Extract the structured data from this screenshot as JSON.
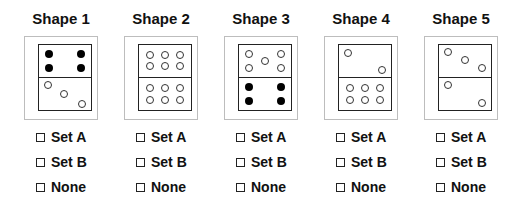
{
  "shapes": [
    {
      "title": "Shape 1",
      "center_x": 61,
      "top": [
        {
          "x": 0.2,
          "y": 0.3,
          "f": 1
        },
        {
          "x": 0.8,
          "y": 0.3,
          "f": 1
        },
        {
          "x": 0.2,
          "y": 0.72,
          "f": 1
        },
        {
          "x": 0.8,
          "y": 0.72,
          "f": 1
        }
      ],
      "bottom": [
        {
          "x": 0.18,
          "y": 0.22,
          "f": 0
        },
        {
          "x": 0.48,
          "y": 0.52,
          "f": 0
        },
        {
          "x": 0.82,
          "y": 0.8,
          "f": 0
        }
      ]
    },
    {
      "title": "Shape 2",
      "center_x": 161,
      "top": [
        {
          "x": 0.22,
          "y": 0.32,
          "f": 0
        },
        {
          "x": 0.5,
          "y": 0.32,
          "f": 0
        },
        {
          "x": 0.78,
          "y": 0.32,
          "f": 0
        },
        {
          "x": 0.22,
          "y": 0.68,
          "f": 0
        },
        {
          "x": 0.5,
          "y": 0.68,
          "f": 0
        },
        {
          "x": 0.78,
          "y": 0.68,
          "f": 0
        }
      ],
      "bottom": [
        {
          "x": 0.22,
          "y": 0.32,
          "f": 0
        },
        {
          "x": 0.5,
          "y": 0.32,
          "f": 0
        },
        {
          "x": 0.78,
          "y": 0.32,
          "f": 0
        },
        {
          "x": 0.22,
          "y": 0.68,
          "f": 0
        },
        {
          "x": 0.5,
          "y": 0.68,
          "f": 0
        },
        {
          "x": 0.78,
          "y": 0.68,
          "f": 0
        }
      ]
    },
    {
      "title": "Shape 3",
      "center_x": 261,
      "top": [
        {
          "x": 0.2,
          "y": 0.3,
          "f": 0
        },
        {
          "x": 0.8,
          "y": 0.3,
          "f": 0
        },
        {
          "x": 0.5,
          "y": 0.5,
          "f": 0
        },
        {
          "x": 0.2,
          "y": 0.72,
          "f": 0
        },
        {
          "x": 0.8,
          "y": 0.72,
          "f": 0
        }
      ],
      "bottom": [
        {
          "x": 0.2,
          "y": 0.3,
          "f": 1
        },
        {
          "x": 0.8,
          "y": 0.3,
          "f": 1
        },
        {
          "x": 0.2,
          "y": 0.72,
          "f": 1
        },
        {
          "x": 0.8,
          "y": 0.72,
          "f": 1
        }
      ]
    },
    {
      "title": "Shape 4",
      "center_x": 361,
      "top": [
        {
          "x": 0.18,
          "y": 0.25,
          "f": 0
        },
        {
          "x": 0.82,
          "y": 0.78,
          "f": 0
        }
      ],
      "bottom": [
        {
          "x": 0.22,
          "y": 0.32,
          "f": 0
        },
        {
          "x": 0.5,
          "y": 0.32,
          "f": 0
        },
        {
          "x": 0.78,
          "y": 0.32,
          "f": 0
        },
        {
          "x": 0.22,
          "y": 0.68,
          "f": 0
        },
        {
          "x": 0.5,
          "y": 0.68,
          "f": 0
        },
        {
          "x": 0.78,
          "y": 0.68,
          "f": 0
        }
      ]
    },
    {
      "title": "Shape 5",
      "center_x": 461,
      "top": [
        {
          "x": 0.18,
          "y": 0.22,
          "f": 0
        },
        {
          "x": 0.5,
          "y": 0.48,
          "f": 0
        },
        {
          "x": 0.82,
          "y": 0.74,
          "f": 0
        }
      ],
      "bottom": [
        {
          "x": 0.18,
          "y": 0.22,
          "f": 0
        },
        {
          "x": 0.82,
          "y": 0.78,
          "f": 0
        }
      ]
    }
  ],
  "options": [
    "Set A",
    "Set B",
    "None"
  ]
}
